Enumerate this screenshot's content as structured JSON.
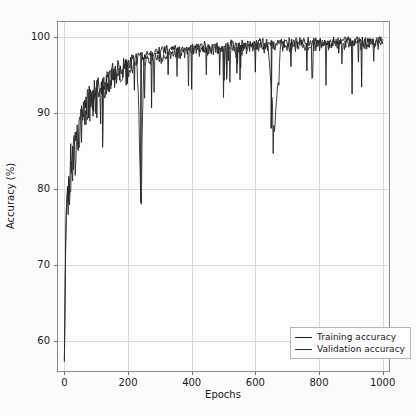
{
  "chart_data": {
    "type": "line",
    "title": "",
    "xlabel": "Epochs",
    "ylabel": "Accuracy (%)",
    "xlim": [
      -20,
      1020
    ],
    "ylim": [
      56,
      102
    ],
    "xticks": [
      0,
      200,
      400,
      600,
      800,
      1000
    ],
    "yticks": [
      60,
      70,
      80,
      90,
      100
    ],
    "grid": true,
    "legend_position": "lower right",
    "colors": {
      "training": "#1a1a1a",
      "validation": "#2b2b2b",
      "grid": "#d9d9d9",
      "frame": "#8a8a8a"
    },
    "series": [
      {
        "name": "Training accuracy",
        "color": "#1a1a1a",
        "x": [
          0,
          5,
          10,
          15,
          20,
          25,
          30,
          35,
          40,
          45,
          50,
          55,
          60,
          65,
          70,
          75,
          80,
          85,
          90,
          95,
          100,
          110,
          120,
          130,
          140,
          150,
          160,
          170,
          180,
          190,
          200,
          210,
          220,
          230,
          240,
          250,
          260,
          270,
          280,
          290,
          300,
          320,
          340,
          360,
          380,
          400,
          420,
          440,
          460,
          480,
          500,
          520,
          540,
          560,
          580,
          600,
          620,
          640,
          660,
          680,
          700,
          720,
          740,
          760,
          780,
          800,
          820,
          840,
          860,
          880,
          900,
          920,
          940,
          960,
          980,
          1000
        ],
        "values": [
          57.4,
          76.8,
          80.6,
          83.1,
          85.0,
          86.1,
          87.3,
          88.0,
          88.9,
          89.5,
          90.2,
          90.8,
          91.3,
          91.8,
          92.2,
          92.6,
          93.0,
          93.3,
          93.6,
          93.9,
          94.2,
          94.7,
          95.1,
          95.5,
          95.8,
          96.1,
          96.4,
          96.6,
          96.8,
          97.0,
          97.2,
          97.4,
          97.6,
          97.7,
          97.9,
          98.0,
          98.1,
          98.2,
          98.3,
          98.4,
          98.5,
          98.7,
          98.8,
          98.9,
          99.0,
          99.1,
          99.2,
          99.2,
          99.3,
          99.3,
          99.4,
          99.4,
          99.5,
          99.5,
          99.5,
          99.6,
          99.6,
          99.6,
          99.6,
          99.7,
          99.7,
          99.7,
          99.7,
          99.8,
          99.8,
          99.8,
          99.8,
          99.8,
          99.9,
          99.9,
          99.9,
          99.9,
          99.9,
          99.9,
          99.9,
          99.9
        ]
      },
      {
        "name": "Validation accuracy",
        "color": "#2b2b2b",
        "x": [
          0,
          5,
          10,
          15,
          20,
          25,
          30,
          35,
          40,
          45,
          50,
          55,
          60,
          65,
          70,
          75,
          80,
          85,
          90,
          95,
          100,
          110,
          120,
          130,
          140,
          150,
          160,
          170,
          180,
          190,
          200,
          210,
          220,
          230,
          240,
          250,
          260,
          270,
          280,
          290,
          300,
          320,
          340,
          360,
          380,
          400,
          420,
          440,
          460,
          480,
          500,
          520,
          540,
          560,
          580,
          600,
          620,
          640,
          660,
          680,
          700,
          720,
          740,
          760,
          780,
          800,
          820,
          840,
          860,
          880,
          900,
          920,
          940,
          960,
          980,
          1000
        ],
        "values": [
          57.2,
          76.0,
          79.8,
          82.4,
          84.2,
          85.3,
          86.5,
          87.2,
          88.1,
          88.7,
          89.4,
          90.0,
          90.5,
          91.0,
          91.5,
          91.9,
          92.3,
          92.6,
          92.9,
          93.2,
          93.5,
          94.0,
          94.4,
          94.8,
          95.1,
          95.4,
          95.7,
          95.9,
          96.1,
          96.3,
          96.6,
          96.8,
          97.0,
          97.1,
          79.5,
          97.4,
          97.5,
          97.6,
          97.7,
          97.8,
          97.9,
          98.1,
          98.2,
          98.4,
          98.5,
          98.6,
          98.7,
          98.7,
          98.8,
          98.9,
          98.9,
          99.0,
          99.0,
          99.1,
          99.1,
          99.1,
          99.2,
          99.2,
          88.0,
          99.3,
          99.3,
          99.3,
          99.4,
          99.4,
          99.4,
          99.5,
          99.5,
          99.5,
          99.6,
          99.6,
          99.6,
          99.6,
          99.7,
          99.7,
          99.7,
          99.7
        ]
      }
    ],
    "notable_dips": [
      {
        "epoch": 240,
        "value": 79.5
      },
      {
        "epoch": 650,
        "value": 88.0
      },
      {
        "epoch": 120,
        "value": 85.5
      }
    ]
  },
  "legend": {
    "items": [
      {
        "label": "Training accuracy",
        "color": "#1a1a1a"
      },
      {
        "label": "Validation accuracy",
        "color": "#2b2b2b"
      }
    ]
  }
}
